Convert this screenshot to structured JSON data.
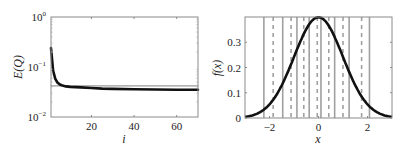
{
  "chart_data": [
    {
      "type": "line",
      "panel": "left",
      "title": "",
      "xlabel": "i",
      "ylabel": "E(Q)",
      "xlim": [
        1,
        70
      ],
      "ylim": [
        0.01,
        1
      ],
      "yscale": "log",
      "xticks": [
        20,
        40,
        60
      ],
      "xtick_labels": [
        "20",
        "40",
        "60"
      ],
      "yticks": [
        0.01,
        0.1,
        1
      ],
      "ytick_labels": [
        "10^-2",
        "10^-1",
        "10^0"
      ],
      "grid": false,
      "legend": null,
      "series": [
        {
          "name": "E(Q) per iteration",
          "color": "#111111",
          "style": "solid-thick",
          "x": [
            1,
            2,
            3,
            4,
            5,
            6,
            8,
            10,
            15,
            20,
            25,
            30,
            40,
            50,
            60,
            70
          ],
          "y": [
            0.24,
            0.085,
            0.058,
            0.049,
            0.045,
            0.043,
            0.041,
            0.04,
            0.039,
            0.038,
            0.037,
            0.0365,
            0.036,
            0.0355,
            0.035,
            0.035
          ]
        },
        {
          "name": "reference level",
          "color": "#9a9a9a",
          "style": "solid-thin",
          "x": [
            1,
            70
          ],
          "y": [
            0.042,
            0.042
          ]
        }
      ]
    },
    {
      "type": "line",
      "panel": "right",
      "title": "",
      "xlabel": "x",
      "ylabel": "f(x)",
      "xlim": [
        -3,
        3
      ],
      "ylim": [
        0,
        0.4
      ],
      "xticks": [
        -2,
        0,
        2
      ],
      "xtick_labels": [
        "−2",
        "0",
        "2"
      ],
      "yticks": [
        0,
        0.1,
        0.2,
        0.3
      ],
      "ytick_labels": [
        "0",
        "0.1",
        "0.2",
        "0.3"
      ],
      "grid": false,
      "legend": null,
      "series": [
        {
          "name": "standard normal pdf",
          "color": "#111111",
          "style": "solid-thick",
          "function": "exp(-x^2/2)/sqrt(2*pi)",
          "x": [
            -3,
            -2.5,
            -2,
            -1.5,
            -1,
            -0.5,
            0,
            0.5,
            1,
            1.5,
            2,
            2.5,
            3
          ],
          "y": [
            0.0044,
            0.0175,
            0.054,
            0.1295,
            0.242,
            0.352,
            0.399,
            0.352,
            0.242,
            0.1295,
            0.054,
            0.0175,
            0.0044
          ]
        }
      ],
      "vertical_lines": {
        "boundaries_solid": {
          "color": "#a0a0a0",
          "x": [
            -2.23,
            -1.46,
            -0.88,
            -0.38,
            0.1,
            0.66,
            1.25,
            2.08
          ]
        },
        "centers_dashed": {
          "color": "#a0a0a0",
          "x": [
            -1.85,
            -1.12,
            -0.6,
            -0.05,
            0.42,
            1.0,
            1.76
          ]
        }
      }
    }
  ]
}
